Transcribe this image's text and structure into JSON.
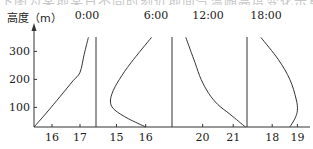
{
  "caption_fragment": "下图为某地某日不同时刻近地面气温随高度变化示意图",
  "chart_data": {
    "type": "line",
    "title": "",
    "ylabel": "高度（m）",
    "xlabel": "气温（℃）",
    "ylim": [
      30,
      355
    ],
    "yticks": [
      100,
      200,
      300
    ],
    "grid": false,
    "legend": "none",
    "panels": [
      {
        "name": "0:00",
        "xticks": [
          16,
          17
        ],
        "xlim": [
          15.36,
          17.57
        ],
        "points": [
          [
            15.36,
            30
          ],
          [
            15.8,
            80
          ],
          [
            16.3,
            140
          ],
          [
            16.75,
            195
          ],
          [
            17.0,
            225
          ],
          [
            17.15,
            290
          ],
          [
            17.3,
            350
          ]
        ]
      },
      {
        "name": "6:00",
        "xticks": [
          15,
          16
        ],
        "xlim": [
          14.3,
          16.9
        ],
        "points": [
          [
            16.0,
            30
          ],
          [
            15.4,
            60
          ],
          [
            14.95,
            90
          ],
          [
            14.8,
            115
          ],
          [
            14.85,
            150
          ],
          [
            15.1,
            200
          ],
          [
            15.5,
            260
          ],
          [
            16.2,
            350
          ]
        ]
      },
      {
        "name": "12:00",
        "xticks": [
          20,
          21
        ],
        "xlim": [
          19.0,
          21.45
        ],
        "points": [
          [
            21.4,
            30
          ],
          [
            20.9,
            75
          ],
          [
            20.5,
            110
          ],
          [
            20.2,
            150
          ],
          [
            19.95,
            200
          ],
          [
            19.75,
            260
          ],
          [
            19.45,
            350
          ]
        ]
      },
      {
        "name": "18:00",
        "xticks": [
          18,
          19
        ],
        "xlim": [
          17.0,
          19.5
        ],
        "points": [
          [
            18.7,
            30
          ],
          [
            18.9,
            60
          ],
          [
            19.0,
            90
          ],
          [
            18.95,
            130
          ],
          [
            18.7,
            200
          ],
          [
            18.25,
            270
          ],
          [
            17.55,
            350
          ]
        ]
      }
    ]
  }
}
